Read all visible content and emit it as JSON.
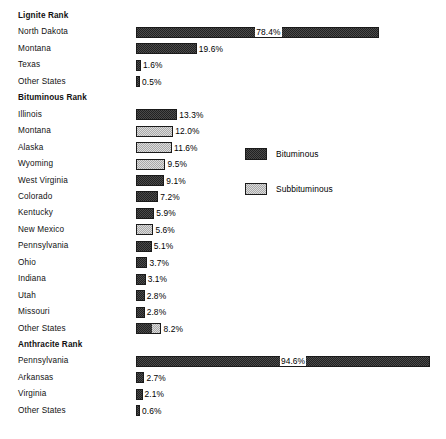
{
  "chart_data": {
    "type": "bar",
    "title": "",
    "xlabel": "",
    "ylabel": "",
    "orientation": "horizontal",
    "grid": false,
    "xlim": [
      0,
      100
    ],
    "value_suffix": "%",
    "legend": {
      "position": "right",
      "entries": [
        {
          "label": "Bituminous",
          "pattern": "dark-checker",
          "color": "#3a3a3a"
        },
        {
          "label": "Subbituminous",
          "pattern": "light-checker",
          "color": "#d0d0d0"
        }
      ]
    },
    "sections": [
      {
        "name": "Lignite Rank",
        "categories": [
          "North Dakota",
          "Montana",
          "Texas",
          "Other States"
        ],
        "values": [
          78.4,
          19.6,
          1.6,
          0.5
        ],
        "value_labels": [
          "78.4%",
          "19.6%",
          "1.6%",
          "0.5%"
        ],
        "types": [
          "bituminous",
          "bituminous",
          "bituminous",
          "bituminous"
        ]
      },
      {
        "name": "Bituminous Rank",
        "categories": [
          "Illinois",
          "Montana",
          "Alaska",
          "Wyoming",
          "West Virginia",
          "Colorado",
          "Kentucky",
          "New Mexico",
          "Pennsylvania",
          "Ohio",
          "Indiana",
          "Utah",
          "Missouri",
          "Other States"
        ],
        "values": [
          13.3,
          12.0,
          11.6,
          9.5,
          9.1,
          7.2,
          5.9,
          5.6,
          5.1,
          3.7,
          3.1,
          2.8,
          2.8,
          8.2
        ],
        "value_labels": [
          "13.3%",
          "12.0%",
          "11.6%",
          "9.5%",
          "9.1%",
          "7.2%",
          "5.9%",
          "5.6%",
          "5.1%",
          "3.7%",
          "3.1%",
          "2.8%",
          "2.8%",
          "8.2%"
        ],
        "types": [
          "bituminous",
          "subbituminous",
          "subbituminous",
          "subbituminous",
          "bituminous",
          "bituminous",
          "bituminous",
          "subbituminous",
          "bituminous",
          "bituminous",
          "bituminous",
          "bituminous",
          "bituminous",
          "mixed"
        ]
      },
      {
        "name": "Anthracite Rank",
        "categories": [
          "Pennsylvania",
          "Arkansas",
          "Virginia",
          "Other States"
        ],
        "values": [
          94.6,
          2.7,
          2.1,
          0.6
        ],
        "value_labels": [
          "94.6%",
          "2.7%",
          "2.1%",
          "0.6%"
        ],
        "types": [
          "bituminous",
          "bituminous",
          "bituminous",
          "bituminous"
        ]
      }
    ]
  }
}
